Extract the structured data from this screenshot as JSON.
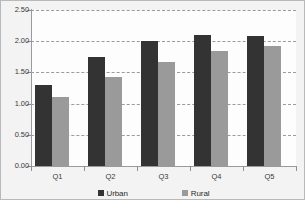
{
  "chart_data": {
    "type": "bar",
    "title": "",
    "subtitle": "",
    "xlabel": "",
    "ylabel": "",
    "categories": [
      "Q1",
      "Q2",
      "Q3",
      "Q4",
      "Q5"
    ],
    "series": [
      {
        "name": "Urban",
        "color": "#333333",
        "values": [
          1.3,
          1.75,
          2.01,
          2.1,
          2.08
        ]
      },
      {
        "name": "Rural",
        "color": "#9a9a9a",
        "values": [
          1.1,
          1.43,
          1.66,
          1.84,
          1.93
        ]
      }
    ],
    "ylim": [
      0.0,
      2.5
    ],
    "ytick_values": [
      0.0,
      0.5,
      1.0,
      1.5,
      2.0,
      2.5
    ],
    "ytick_labels": [
      "0.00",
      "0.50",
      "1.00",
      "1.50",
      "2.00",
      "2.50"
    ],
    "grid": true,
    "grid_axis": "y",
    "grid_style": "dashed",
    "legend_position": "bottom-center",
    "legend_entries": [
      "Urban",
      "Rural"
    ],
    "annotations": []
  },
  "axes": {
    "y_labels": [
      "2.50",
      "2.00",
      "1.50",
      "1.00",
      "0.50",
      "0.00"
    ],
    "x_labels": [
      "Q1",
      "Q2",
      "Q3",
      "Q4",
      "Q5"
    ]
  },
  "legend": {
    "items": [
      {
        "label": "Urban",
        "swatch": "dark-square-swatch"
      },
      {
        "label": "Rural",
        "swatch": "gray-square-swatch"
      }
    ]
  }
}
